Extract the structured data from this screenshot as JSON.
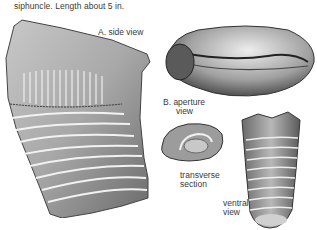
{
  "caption": "siphuncle. Length about 5 in.",
  "figures": {
    "side_view": {
      "label": "A.  side view"
    },
    "aperture_view": {
      "label_line1": "B.  aperture",
      "label_line2": "view"
    },
    "transverse_section": {
      "label_line1": "transverse",
      "label_line2": "section"
    },
    "ventral_view": {
      "label_line1": "ventral",
      "label_line2": "view"
    }
  },
  "colors": {
    "ink": "#3a3a3a",
    "shell_light": "#d8d8d8",
    "shell_mid": "#9a9a9a",
    "shell_dark": "#4a4a4a"
  }
}
